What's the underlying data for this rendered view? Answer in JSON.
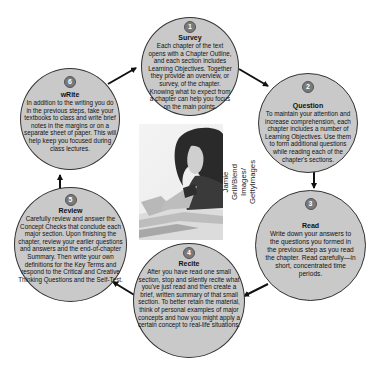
{
  "diagram": {
    "type": "cycle",
    "steps": [
      {
        "number": "1",
        "title": "Survey",
        "body": "Each chapter of the text opens with a Chapter Outline, and each section includes Learning Objectives. Together they provide an overview, or survey, of the chapter. Knowing what to expect from a chapter can help you focus on the main points."
      },
      {
        "number": "2",
        "title": "Question",
        "body": "To maintain your attention and increase comprehension, each chapter includes a number of Learning Objectives. Use them to form additional questions while reading each of the chapter's sections."
      },
      {
        "number": "3",
        "title": "Read",
        "body": "Write down your answers to the questions you formed in the previous step as you read the chapter. Read carefully—in short, concentrated time periods."
      },
      {
        "number": "4",
        "title": "Recite",
        "body": "After you have read one small section, stop and silently recite what you've just read and then create a brief, written summary of that small section. To better retain the material, think of personal examples of major concepts and how you might apply a certain concept to real-life situations."
      },
      {
        "number": "5",
        "title": "Review",
        "body": "Carefully review and answer the Concept Checks that conclude each major section. Upon finishing the chapter, review your earlier questions and answers and the end-of-chapter Summary. Then write your own definitions for the Key Terms and respond to the Critical and Creative Thinking Questions and the Self-Test."
      },
      {
        "number": "6",
        "title": "wRite",
        "body": "In addition to the writing you do in the previous steps, take your textbooks to class and write brief notes in the margins or on a separate sheet of paper. This will help keep you focused during class lectures."
      }
    ],
    "photo": {
      "description": "Young woman with long dark hair studying and writing at a desk with books",
      "credit": "Jamie Grill/Blend Images/ GettyImages"
    }
  },
  "colors": {
    "circle_fill": "#c9c9c9",
    "circle_border": "#333333",
    "badge_fill": "#7a7a7a",
    "arrow": "#111111",
    "background": "#ffffff"
  }
}
